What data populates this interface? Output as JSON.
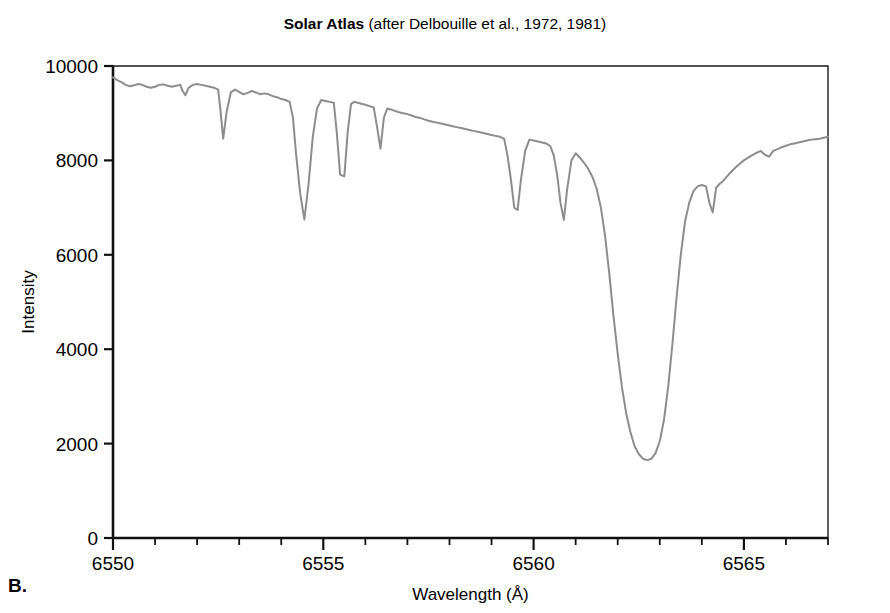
{
  "panel": {
    "label": "B."
  },
  "title": {
    "main": "Solar Atlas",
    "reference": " (after Delbouille et al., 1972, 1981)"
  },
  "chart_data": {
    "type": "line",
    "title": "Solar Atlas (after Delbouille et al., 1972, 1981)",
    "xlabel": "Wavelength (Å)",
    "ylabel": "Intensity",
    "xlim": [
      6550,
      6567.0
    ],
    "ylim": [
      0,
      10000
    ],
    "grid": false,
    "legend": null,
    "xticks_major": [
      6550,
      6555,
      6560,
      6565
    ],
    "xticklabels_major": [
      "6550",
      "6555",
      "6560",
      "6565"
    ],
    "xticks_minor": [
      6551,
      6552,
      6553,
      6554,
      6556,
      6557,
      6558,
      6559,
      6561,
      6562,
      6563,
      6564,
      6566,
      6567
    ],
    "yticks": [
      0,
      2000,
      4000,
      6000,
      8000,
      10000
    ],
    "yticklabels": [
      "0",
      "2000",
      "4000",
      "6000",
      "8000",
      "10000"
    ],
    "line_color": "#8d8d8d",
    "line_width": 2.0,
    "series": [
      {
        "name": "Solar spectrum intensity",
        "x": [
          6550.0,
          6550.1,
          6550.2,
          6550.3,
          6550.4,
          6550.5,
          6550.6,
          6550.7,
          6550.8,
          6550.9,
          6551.0,
          6551.1,
          6551.2,
          6551.3,
          6551.4,
          6551.5,
          6551.6,
          6551.65,
          6551.72,
          6551.8,
          6551.9,
          6552.0,
          6552.1,
          6552.2,
          6552.3,
          6552.4,
          6552.5,
          6552.55,
          6552.62,
          6552.7,
          6552.8,
          6552.9,
          6553.0,
          6553.1,
          6553.2,
          6553.3,
          6553.4,
          6553.5,
          6553.6,
          6553.7,
          6553.8,
          6553.9,
          6554.0,
          6554.1,
          6554.2,
          6554.28,
          6554.35,
          6554.45,
          6554.55,
          6554.65,
          6554.75,
          6554.85,
          6554.95,
          6555.05,
          6555.15,
          6555.25,
          6555.32,
          6555.4,
          6555.5,
          6555.58,
          6555.66,
          6555.74,
          6555.82,
          6555.9,
          6556.0,
          6556.1,
          6556.2,
          6556.28,
          6556.36,
          6556.44,
          6556.52,
          6556.6,
          6556.7,
          6556.8,
          6556.9,
          6557.0,
          6557.1,
          6557.2,
          6557.3,
          6557.4,
          6557.5,
          6557.6,
          6557.7,
          6557.8,
          6557.9,
          6558.0,
          6558.1,
          6558.2,
          6558.3,
          6558.4,
          6558.5,
          6558.6,
          6558.7,
          6558.8,
          6558.9,
          6559.0,
          6559.1,
          6559.2,
          6559.3,
          6559.38,
          6559.46,
          6559.54,
          6559.62,
          6559.7,
          6559.8,
          6559.9,
          6560.0,
          6560.1,
          6560.2,
          6560.3,
          6560.4,
          6560.48,
          6560.56,
          6560.64,
          6560.72,
          6560.8,
          6560.9,
          6561.0,
          6561.1,
          6561.2,
          6561.3,
          6561.4,
          6561.5,
          6561.6,
          6561.7,
          6561.8,
          6561.9,
          6562.0,
          6562.1,
          6562.2,
          6562.3,
          6562.4,
          6562.5,
          6562.6,
          6562.7,
          6562.8,
          6562.9,
          6563.0,
          6563.1,
          6563.2,
          6563.3,
          6563.4,
          6563.5,
          6563.6,
          6563.7,
          6563.8,
          6563.9,
          6564.0,
          6564.1,
          6564.18,
          6564.26,
          6564.34,
          6564.42,
          6564.5,
          6564.6,
          6564.7,
          6564.8,
          6564.9,
          6565.0,
          6565.1,
          6565.2,
          6565.3,
          6565.4,
          6565.5,
          6565.6,
          6565.7,
          6565.8,
          6565.9,
          6566.0,
          6566.1,
          6566.2,
          6566.3,
          6566.4,
          6566.5,
          6566.6,
          6566.7,
          6566.8,
          6566.9,
          6567.0
        ],
        "y": [
          9760,
          9700,
          9660,
          9600,
          9570,
          9590,
          9620,
          9600,
          9560,
          9540,
          9560,
          9600,
          9610,
          9580,
          9560,
          9580,
          9600,
          9480,
          9380,
          9540,
          9600,
          9620,
          9600,
          9580,
          9560,
          9540,
          9500,
          9100,
          8460,
          9020,
          9440,
          9500,
          9450,
          9400,
          9430,
          9470,
          9440,
          9400,
          9420,
          9400,
          9360,
          9340,
          9300,
          9280,
          9240,
          8900,
          8160,
          7300,
          6750,
          7500,
          8500,
          9100,
          9280,
          9260,
          9240,
          9220,
          8600,
          7700,
          7660,
          8600,
          9200,
          9240,
          9220,
          9200,
          9180,
          9150,
          9120,
          8700,
          8250,
          8900,
          9100,
          9080,
          9050,
          9020,
          9000,
          8980,
          8950,
          8920,
          8900,
          8870,
          8840,
          8820,
          8800,
          8780,
          8760,
          8740,
          8720,
          8700,
          8680,
          8660,
          8640,
          8620,
          8600,
          8580,
          8560,
          8540,
          8520,
          8500,
          8460,
          8100,
          7600,
          7000,
          6950,
          7600,
          8200,
          8440,
          8420,
          8400,
          8380,
          8360,
          8300,
          8100,
          7700,
          7100,
          6740,
          7400,
          8000,
          8150,
          8060,
          7950,
          7820,
          7650,
          7400,
          7000,
          6400,
          5600,
          4700,
          3900,
          3200,
          2650,
          2250,
          1950,
          1780,
          1680,
          1650,
          1680,
          1800,
          2050,
          2500,
          3200,
          4100,
          5100,
          6000,
          6700,
          7100,
          7350,
          7450,
          7480,
          7450,
          7100,
          6900,
          7420,
          7500,
          7560,
          7660,
          7760,
          7850,
          7930,
          8000,
          8060,
          8110,
          8160,
          8200,
          8120,
          8080,
          8200,
          8240,
          8280,
          8310,
          8340,
          8360,
          8380,
          8400,
          8420,
          8440,
          8450,
          8460,
          8480,
          8500
        ]
      }
    ],
    "annotations": [
      {
        "name": "h-alpha-core",
        "wavelength": 6562.7,
        "intensity": 1650
      },
      {
        "name": "deep-line-6554",
        "wavelength": 6554.55,
        "intensity": 6750
      },
      {
        "name": "deep-line-6555",
        "wavelength": 6555.66,
        "intensity": 7660
      },
      {
        "name": "deep-line-6559",
        "wavelength": 6559.62,
        "intensity": 6950
      },
      {
        "name": "deep-line-6560",
        "wavelength": 6560.64,
        "intensity": 6740
      },
      {
        "name": "line-6552",
        "wavelength": 6552.62,
        "intensity": 8460
      }
    ]
  }
}
